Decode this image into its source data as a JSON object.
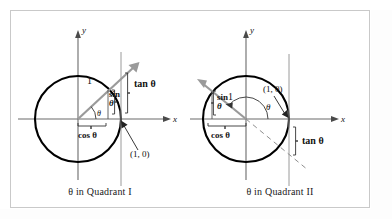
{
  "figure": {
    "background_color": "#ffffff",
    "frame_color": "#c9c9c9",
    "circle_color": "#000000",
    "axis_color": "#6b6b6b",
    "ray_color": "#8a8a8a",
    "text_color": "#111111"
  },
  "panels": [
    {
      "id": "quadrant-1",
      "caption": "θ in Quadrant I",
      "axis_x_label": "x",
      "axis_y_label": "y",
      "labels": {
        "radius": "1",
        "sin_line1": "sin",
        "sin_line2": "θ",
        "cos": "cos θ",
        "tan": "tan θ",
        "theta": "θ",
        "point": "(1, 0)"
      },
      "geometry": {
        "center_x": 68,
        "center_y": 109,
        "radius": 43,
        "tangent_x": 111,
        "ray_angle_deg": 43,
        "ray_length": 72
      }
    },
    {
      "id": "quadrant-2",
      "caption": "θ in Quadrant II",
      "axis_x_label": "x",
      "axis_y_label": "y",
      "labels": {
        "radius": "1",
        "sin_line1": "sin",
        "sin_line2": "θ",
        "cos": "cos θ",
        "tan": "tan θ",
        "theta": "θ",
        "point": "(1, 0)"
      },
      "geometry": {
        "center_x": 56,
        "center_y": 109,
        "radius": 43,
        "tangent_x": 99,
        "ray_angle_deg": 153,
        "ray_length": 72
      }
    }
  ]
}
